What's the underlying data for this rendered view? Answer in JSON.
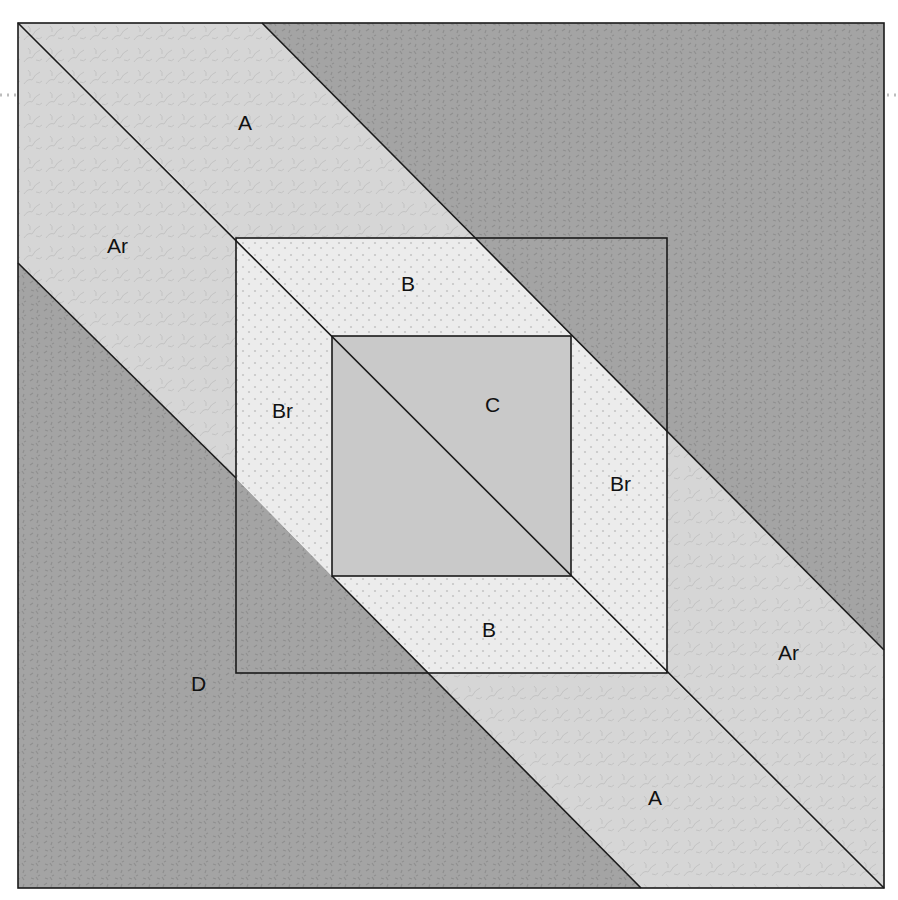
{
  "diagram": {
    "type": "quilt-block-piecing-diagram",
    "colors": {
      "background": "#ffffff",
      "fabric_D_dark": "#a4a4a4",
      "fabric_D_speck": "#8e8e8e",
      "fabric_A_light": "#d6d6d6",
      "fabric_A_vein": "#c4c4c4",
      "fabric_B_dotted": "#ececec",
      "fabric_B_dot": "#c2c2c2",
      "fabric_C_solid": "#c9c9c9",
      "outline": "#1a1a1a",
      "guide_dots": "#bdbdbd"
    },
    "pieces": [
      {
        "id": "D-top-right",
        "label": "",
        "fabric": "D"
      },
      {
        "id": "A-top",
        "label": "A",
        "fabric": "A"
      },
      {
        "id": "Ar-left",
        "label": "Ar",
        "fabric": "A"
      },
      {
        "id": "B-top",
        "label": "B",
        "fabric": "B"
      },
      {
        "id": "Br-left",
        "label": "Br",
        "fabric": "B"
      },
      {
        "id": "C-center",
        "label": "C",
        "fabric": "C"
      },
      {
        "id": "Br-right",
        "label": "Br",
        "fabric": "B"
      },
      {
        "id": "B-bottom",
        "label": "B",
        "fabric": "B"
      },
      {
        "id": "Ar-right",
        "label": "Ar",
        "fabric": "A"
      },
      {
        "id": "A-bottom",
        "label": "A",
        "fabric": "A"
      },
      {
        "id": "D-bottom-left",
        "label": "D",
        "fabric": "D"
      }
    ],
    "labels": {
      "a_top": "A",
      "ar_left": "Ar",
      "b_top": "B",
      "br_left": "Br",
      "c_center": "C",
      "br_right": "Br",
      "b_bottom": "B",
      "ar_right": "Ar",
      "a_bottom": "A",
      "d_bottom_left": "D"
    }
  }
}
